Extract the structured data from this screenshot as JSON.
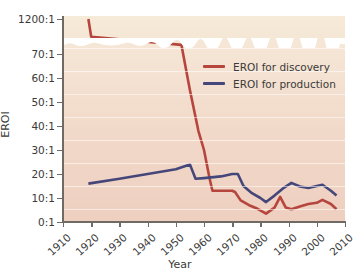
{
  "chart_data": {
    "type": "line",
    "title": "",
    "xlabel": "Year",
    "ylabel": "EROI",
    "xlim": [
      1910,
      2010
    ],
    "ylim": [
      0,
      70
    ],
    "grid": true,
    "broken_axis": {
      "present": true,
      "upper_tick_label": "1200:1",
      "break_between": [
        70,
        1200
      ],
      "note": "y-axis is broken between 70:1 and 1200:1"
    },
    "legend_position": "inside-upper-right",
    "y_tick_labels": [
      "0:1",
      "10:1",
      "20:1",
      "30:1",
      "40:1",
      "50:1",
      "60:1",
      "70:1",
      "1200:1"
    ],
    "y_tick_values": [
      0,
      10,
      20,
      30,
      40,
      50,
      60,
      70,
      1200
    ],
    "x_tick_labels": [
      "1910",
      "1920",
      "1930",
      "1940",
      "1950",
      "1960",
      "1970",
      "1980",
      "1990",
      "2000",
      "2010"
    ],
    "x_tick_values": [
      1910,
      1920,
      1930,
      1940,
      1950,
      1960,
      1970,
      1980,
      1990,
      2000,
      2010
    ],
    "series": [
      {
        "name": "EROI for discovery",
        "color": "#b5453d",
        "points": [
          [
            1919,
            1200
          ],
          [
            1920,
            430
          ],
          [
            1952,
            74
          ],
          [
            1955,
            55
          ],
          [
            1958,
            38
          ],
          [
            1960,
            30
          ],
          [
            1962,
            18
          ],
          [
            1963,
            13
          ],
          [
            1966,
            13
          ],
          [
            1970,
            13
          ],
          [
            1971,
            12.5
          ],
          [
            1973,
            9
          ],
          [
            1976,
            7
          ],
          [
            1979,
            5.5
          ],
          [
            1982,
            3.5
          ],
          [
            1985,
            6
          ],
          [
            1987,
            10.5
          ],
          [
            1989,
            6
          ],
          [
            1991,
            5.3
          ],
          [
            1994,
            6.5
          ],
          [
            1997,
            7.5
          ],
          [
            2000,
            8
          ],
          [
            2002,
            9.2
          ],
          [
            2005,
            7.5
          ],
          [
            2007,
            5.3
          ]
        ]
      },
      {
        "name": "EROI for production",
        "color": "#45477a",
        "points": [
          [
            1919,
            16
          ],
          [
            1930,
            18
          ],
          [
            1940,
            20
          ],
          [
            1950,
            22
          ],
          [
            1955,
            24
          ],
          [
            1957,
            18
          ],
          [
            1960,
            18.3
          ],
          [
            1966,
            19
          ],
          [
            1970,
            20
          ],
          [
            1972,
            20
          ],
          [
            1974,
            15
          ],
          [
            1977,
            12
          ],
          [
            1980,
            10
          ],
          [
            1982,
            8.3
          ],
          [
            1985,
            11
          ],
          [
            1988,
            14
          ],
          [
            1991,
            16.3
          ],
          [
            1994,
            14.8
          ],
          [
            1997,
            14.2
          ],
          [
            2000,
            15
          ],
          [
            2002,
            15.5
          ],
          [
            2005,
            13
          ],
          [
            2007,
            11
          ]
        ]
      }
    ]
  },
  "legend": {
    "items": [
      {
        "label": "EROI for discovery",
        "color": "#b5453d"
      },
      {
        "label": "EROI for production",
        "color": "#45477a"
      }
    ]
  },
  "axes": {
    "y_title": "EROI",
    "x_title": "Year"
  },
  "colors": {
    "discovery": "#b5453d",
    "production": "#45477a",
    "plot_bg_top": "#f6ead8",
    "plot_bg_bottom": "#eecfc0",
    "axis": "#6f6a63",
    "text": "#3a3a38"
  }
}
